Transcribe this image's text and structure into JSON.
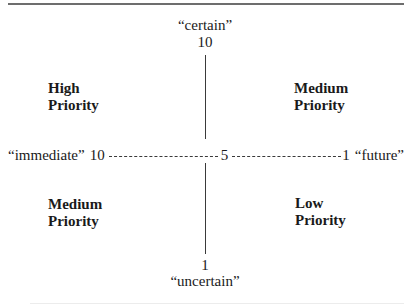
{
  "diagram": {
    "type": "priority-matrix",
    "vertical_axis": {
      "top_label": "“certain”",
      "top_value": "10",
      "bottom_value": "1",
      "bottom_label": "“uncertain”"
    },
    "horizontal_axis": {
      "left_label": "“immediate”",
      "left_value": "10",
      "center_value": "5",
      "right_value": "1",
      "right_label": "“future”"
    },
    "quadrants": {
      "top_left": {
        "line1": "High",
        "line2": "Priority"
      },
      "top_right": {
        "line1": "Medium",
        "line2": "Priority"
      },
      "bottom_left": {
        "line1": "Medium",
        "line2": "Priority"
      },
      "bottom_right": {
        "line1": "Low",
        "line2": "Priority"
      }
    }
  },
  "colors": {
    "text": "#1a1a1a",
    "axis_line": "#3a3a3a",
    "top_rule": "#6d6d6d",
    "background": "#ffffff"
  }
}
